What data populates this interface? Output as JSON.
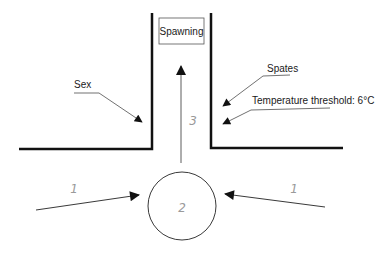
{
  "diagram": {
    "type": "conceptual-flow",
    "nodes": {
      "spawning": {
        "label": "Spawning"
      },
      "circle": {
        "label": "2"
      }
    },
    "numbers": {
      "inflow_left": "1",
      "inflow_right": "1",
      "pool": "2",
      "upstream": "3"
    },
    "factors": {
      "sex": "Sex",
      "spates": "Spates",
      "temperature": "Temperature threshold: 6°C"
    },
    "colors": {
      "line": "#111111",
      "thin_line": "#222222",
      "number_text": "#9a9a9a"
    }
  }
}
